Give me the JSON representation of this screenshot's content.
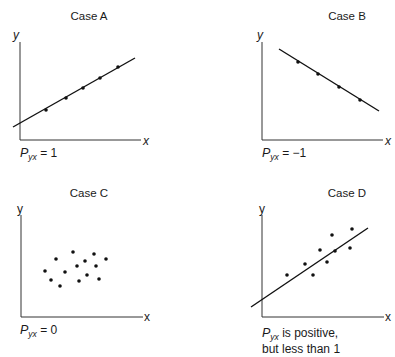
{
  "chart_data": [
    {
      "type": "scatter",
      "title": "Case A",
      "xlabel": "x",
      "ylabel": "y",
      "caption": {
        "symbol": "P",
        "subscript": "yx",
        "text": " = 1"
      },
      "fit_line": {
        "from": [
          13,
          127
        ],
        "to": [
          135,
          58
        ]
      },
      "points": [
        [
          46,
          110
        ],
        [
          66,
          98
        ],
        [
          83,
          88
        ],
        [
          100,
          78
        ],
        [
          118,
          67
        ]
      ],
      "correlation": 1,
      "grid": false
    },
    {
      "type": "scatter",
      "title": "Case B",
      "xlabel": "x",
      "ylabel": "y",
      "caption": {
        "symbol": "P",
        "subscript": "yx",
        "text": " = −1"
      },
      "fit_line": {
        "from": [
          279,
          49
        ],
        "to": [
          379,
          111
        ]
      },
      "points": [
        [
          298,
          62
        ],
        [
          318,
          74
        ],
        [
          339,
          87
        ],
        [
          360,
          100
        ]
      ],
      "correlation": -1,
      "grid": false
    },
    {
      "type": "scatter",
      "title": "Case C",
      "xlabel": "x",
      "ylabel": "y",
      "caption": {
        "symbol": "P",
        "subscript": "yx",
        "text": " = 0"
      },
      "points": [
        [
          45,
          271
        ],
        [
          56,
          259
        ],
        [
          73,
          252
        ],
        [
          94,
          254
        ],
        [
          106,
          259
        ],
        [
          85,
          261
        ],
        [
          77,
          266
        ],
        [
          96,
          266
        ],
        [
          65,
          272
        ],
        [
          87,
          275
        ],
        [
          51,
          280
        ],
        [
          79,
          281
        ],
        [
          99,
          279
        ],
        [
          60,
          286
        ]
      ],
      "correlation": 0,
      "grid": false
    },
    {
      "type": "scatter",
      "title": "Case D",
      "xlabel": "x",
      "ylabel": "y",
      "caption": {
        "symbol": "P",
        "subscript": "yx",
        "text": " is positive,",
        "line2": "but less than 1"
      },
      "fit_line": {
        "from": [
          251,
          307
        ],
        "to": [
          368,
          228
        ]
      },
      "points": [
        [
          287,
          275
        ],
        [
          305,
          264
        ],
        [
          313,
          275
        ],
        [
          320,
          250
        ],
        [
          327,
          262
        ],
        [
          332,
          235
        ],
        [
          335,
          251
        ],
        [
          350,
          248
        ],
        [
          352,
          229
        ]
      ],
      "correlation": "positive, less than 1",
      "grid": false
    }
  ],
  "labels": {
    "caseA": {
      "title": "Case A",
      "x": "x",
      "y": "y",
      "P": "P",
      "sub": "yx",
      "rest": " = 1"
    },
    "caseB": {
      "title": "Case B",
      "x": "x",
      "y": "y",
      "P": "P",
      "sub": "yx",
      "rest": " = −1"
    },
    "caseC": {
      "title": "Case C",
      "x": "x",
      "y": "y",
      "P": "P",
      "sub": "yx",
      "rest": " = 0"
    },
    "caseD": {
      "title": "Case D",
      "x": "x",
      "y": "y",
      "P": "P",
      "sub": "yx",
      "rest": " is positive,",
      "line2": "but less than 1"
    }
  }
}
